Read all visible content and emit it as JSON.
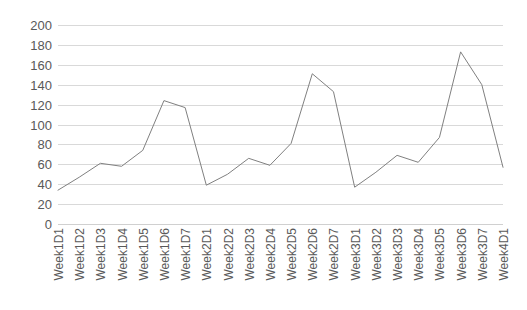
{
  "chart_data": {
    "type": "line",
    "title": "",
    "xlabel": "",
    "ylabel": "",
    "ylim": [
      0,
      200
    ],
    "ytick_step": 20,
    "grid": true,
    "legend": false,
    "legend_position": "none",
    "line_color": "#808080",
    "gridline_color": "#d9d9d9",
    "text_color": "#595959",
    "background": "#ffffff",
    "yticks": [
      0,
      20,
      40,
      60,
      80,
      100,
      120,
      140,
      160,
      180,
      200
    ],
    "categories": [
      "Week1D1",
      "Week1D2",
      "Week1D3",
      "Week1D4",
      "Week1D5",
      "Week1D6",
      "Week1D7",
      "Week2D1",
      "Week2D2",
      "Week2D3",
      "Week2D4",
      "Week2D5",
      "Week2D6",
      "Week2D7",
      "Week3D1",
      "Week3D2",
      "Week3D3",
      "Week3D4",
      "Week3D5",
      "Week3D6",
      "Week3D7",
      "Week4D1"
    ],
    "values": [
      34,
      47,
      61,
      58,
      74,
      124,
      117,
      39,
      50,
      66,
      59,
      81,
      151,
      133,
      37,
      52,
      69,
      62,
      87,
      173,
      140,
      57
    ]
  }
}
